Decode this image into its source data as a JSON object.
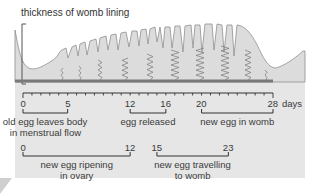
{
  "title": "thickness of womb lining",
  "axis": {
    "unit_label": "days",
    "min_day": 0,
    "max_day": 28,
    "tick_step": 1
  },
  "colors": {
    "panel": "#e6e6e6",
    "lining": "#d9d9d9",
    "outline": "#8a8a8a",
    "baseline": "#7a7a7a",
    "text": "#3a3a3a"
  },
  "row1": [
    {
      "start": 0,
      "end": 5,
      "start_label": "0",
      "end_label": "5",
      "caption": [
        "old egg leaves body",
        "in menstrual flow"
      ]
    },
    {
      "start": 12,
      "end": 16,
      "start_label": "12",
      "end_label": "16",
      "caption": [
        "egg released"
      ]
    },
    {
      "start": 20,
      "end": 28,
      "start_label": "20",
      "end_label": "28",
      "caption": [
        "new egg in womb"
      ]
    }
  ],
  "row2": [
    {
      "start": 0,
      "end": 12,
      "start_label": "0",
      "end_label": "12",
      "caption": [
        "new egg ripening",
        "in ovary"
      ]
    },
    {
      "start": 15,
      "end": 23,
      "start_label": "15",
      "end_label": "23",
      "caption": [
        "new egg travelling",
        "to womb"
      ]
    }
  ]
}
